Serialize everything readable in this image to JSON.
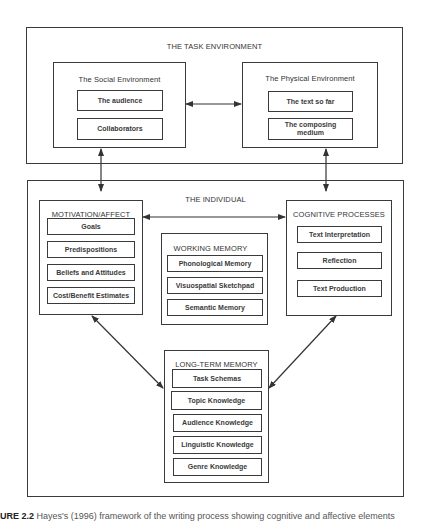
{
  "task_environment": {
    "title": "THE TASK ENVIRONMENT",
    "social": {
      "title": "The Social Environment",
      "items": [
        "The audience",
        "Collaborators"
      ]
    },
    "physical": {
      "title": "The Physical Environment",
      "items": [
        "The text so far",
        "The composing medium"
      ]
    }
  },
  "individual": {
    "title": "THE INDIVIDUAL",
    "motivation": {
      "title": "MOTIVATION/AFFECT",
      "items": [
        "Goals",
        "Predispositions",
        "Beliefs and Attitudes",
        "Cost/Benefit Estimates"
      ]
    },
    "working_memory": {
      "title": "WORKING MEMORY",
      "items": [
        "Phonological Memory",
        "Visuospatial Sketchpad",
        "Semantic Memory"
      ]
    },
    "cognitive": {
      "title": "COGNITIVE PROCESSES",
      "items": [
        "Text Interpretation",
        "Reflection",
        "Text Production"
      ]
    },
    "long_term_memory": {
      "title": "LONG-TERM MEMORY",
      "items": [
        "Task Schemas",
        "Topic Knowledge",
        "Audience Knowledge",
        "Linguistic Knowledge",
        "Genre Knowledge"
      ]
    }
  },
  "connections": [
    {
      "from": "The Social Environment",
      "to": "The Physical Environment",
      "type": "bidirectional"
    },
    {
      "from": "The Social Environment",
      "to": "THE INDIVIDUAL",
      "type": "bidirectional"
    },
    {
      "from": "The Physical Environment",
      "to": "THE INDIVIDUAL",
      "type": "bidirectional"
    },
    {
      "from": "MOTIVATION/AFFECT",
      "to": "COGNITIVE PROCESSES",
      "type": "bidirectional"
    },
    {
      "from": "MOTIVATION/AFFECT",
      "to": "LONG-TERM MEMORY",
      "type": "bidirectional"
    },
    {
      "from": "COGNITIVE PROCESSES",
      "to": "LONG-TERM MEMORY",
      "type": "bidirectional"
    }
  ],
  "caption": {
    "label": "URE 2.2",
    "text": "Hayes's (1996) framework of the writing process showing cognitive and affective elements"
  },
  "colors": {
    "line": "#3a3a3a",
    "background": "#ffffff"
  }
}
